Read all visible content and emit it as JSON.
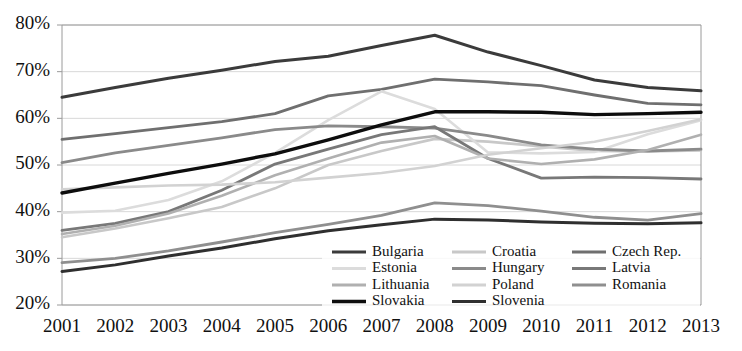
{
  "chart_data": {
    "type": "line",
    "title": "",
    "subtitle": "",
    "xlabel": "",
    "ylabel": "",
    "x": [
      2001,
      2002,
      2003,
      2004,
      2005,
      2006,
      2007,
      2008,
      2009,
      2010,
      2011,
      2012,
      2013
    ],
    "xtick_labels": [
      "2001",
      "2002",
      "2003",
      "2004",
      "2005",
      "2006",
      "2007",
      "2008",
      "2009",
      "2010",
      "2011",
      "2012",
      "2013"
    ],
    "ytick_labels": [
      "80%",
      "70%",
      "60%",
      "50%",
      "40%",
      "30%",
      "20%"
    ],
    "ytick_values": [
      80,
      70,
      60,
      50,
      40,
      30,
      20
    ],
    "ylim": [
      20,
      80
    ],
    "xlim": [
      2001,
      2013
    ],
    "grid": true,
    "legend_position": "bottom-center",
    "value_suffix": "%",
    "series": [
      {
        "name": "Bulgaria",
        "color": "#3b3b3b",
        "width": 3.0,
        "values": [
          64.5,
          66.6,
          68.6,
          70.3,
          72.2,
          73.3,
          75.6,
          77.8,
          74.2,
          71.3,
          68.2,
          66.6,
          65.9
        ]
      },
      {
        "name": "Croatia",
        "color": "#c8c8c8",
        "width": 2.6,
        "values": [
          34.5,
          36.4,
          38.6,
          41.0,
          45.0,
          50.0,
          53.0,
          55.6,
          55.0,
          54.0,
          53.0,
          52.9,
          53.1
        ]
      },
      {
        "name": "Czech Rep.",
        "color": "#6f6f6f",
        "width": 2.8,
        "values": [
          55.5,
          56.7,
          58.0,
          59.3,
          61.0,
          64.8,
          66.2,
          68.4,
          67.8,
          67.0,
          65.0,
          63.2,
          62.9
        ]
      },
      {
        "name": "Estonia",
        "color": "#dcdcdc",
        "width": 2.6,
        "values": [
          39.8,
          40.2,
          42.5,
          46.5,
          52.6,
          59.6,
          65.8,
          62.0,
          52.7,
          52.5,
          52.8,
          56.6,
          59.6
        ]
      },
      {
        "name": "Hungary",
        "color": "#8a8a8a",
        "width": 2.8,
        "values": [
          50.5,
          52.6,
          54.2,
          55.8,
          57.6,
          58.4,
          58.2,
          57.9,
          56.3,
          54.3,
          53.4,
          53.0,
          53.4
        ]
      },
      {
        "name": "Latvia",
        "color": "#787878",
        "width": 2.8,
        "values": [
          36.0,
          37.5,
          40.0,
          44.6,
          50.2,
          53.4,
          56.5,
          58.2,
          51.4,
          47.2,
          47.4,
          47.3,
          47.0
        ]
      },
      {
        "name": "Lithuania",
        "color": "#b0b0b0",
        "width": 2.6,
        "values": [
          35.2,
          37.0,
          39.6,
          43.4,
          47.8,
          51.4,
          54.8,
          56.2,
          51.4,
          50.2,
          51.2,
          53.2,
          56.5
        ]
      },
      {
        "name": "Poland",
        "color": "#d2d2d2",
        "width": 2.6,
        "values": [
          44.8,
          45.2,
          45.6,
          45.8,
          46.3,
          47.3,
          48.3,
          49.8,
          52.2,
          53.6,
          55.0,
          57.3,
          59.8
        ]
      },
      {
        "name": "Romania",
        "color": "#8f8f8f",
        "width": 2.8,
        "values": [
          29.1,
          30.0,
          31.6,
          33.5,
          35.5,
          37.3,
          39.2,
          41.9,
          41.3,
          40.1,
          38.8,
          38.2,
          39.6
        ]
      },
      {
        "name": "Slovakia",
        "color": "#0d0d0d",
        "width": 3.4,
        "values": [
          44.0,
          46.1,
          48.2,
          50.2,
          52.4,
          55.4,
          58.6,
          61.4,
          61.4,
          61.3,
          60.8,
          61.0,
          61.3
        ]
      },
      {
        "name": "Slovenia",
        "color": "#2f2f2f",
        "width": 3.0,
        "values": [
          27.2,
          28.6,
          30.5,
          32.2,
          34.2,
          35.9,
          37.2,
          38.4,
          38.2,
          37.8,
          37.5,
          37.4,
          37.6
        ]
      }
    ],
    "legend_columns": [
      [
        "Bulgaria",
        "Estonia",
        "Lithuania",
        "Slovakia"
      ],
      [
        "Croatia",
        "Hungary",
        "Poland",
        "Slovenia"
      ],
      [
        "Czech Rep.",
        "Latvia",
        "Romania"
      ]
    ]
  }
}
